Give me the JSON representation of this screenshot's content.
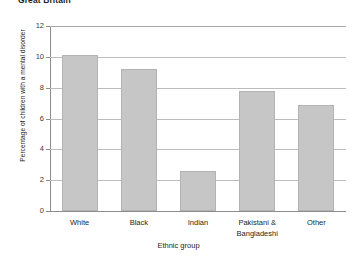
{
  "chart_data": {
    "type": "bar",
    "title": "Great Britain",
    "xlabel": "Ethnic group",
    "ylabel": "Percentage of children with a mental disorder",
    "categories": [
      "White",
      "Black",
      "Indian",
      "Pakistani & Bangladeshi",
      "Other"
    ],
    "values": [
      10.1,
      9.2,
      2.6,
      7.8,
      6.9
    ],
    "ylim": [
      0,
      12
    ],
    "yticks": [
      0,
      2,
      4,
      6,
      8,
      10,
      12
    ],
    "ytick_labels": [
      "0",
      "2",
      "4",
      "6",
      "8",
      "10",
      "12"
    ],
    "grid": true,
    "grid_axis": "y",
    "legend": false,
    "bar_color": "#c6c6c6",
    "bar_edge_color": "#b3b3b3",
    "grid_color": "#bcbcbc",
    "axis_color": "#8d8d8d",
    "text_color": "#231f20",
    "background": "#ffffff"
  },
  "category_labels": [
    {
      "line1": "White",
      "line2": ""
    },
    {
      "line1": "Black",
      "line2": ""
    },
    {
      "line1": "Indian",
      "line2": ""
    },
    {
      "line1": "Pakistani &",
      "line2": "Bangladeshi"
    },
    {
      "line1": "Other",
      "line2": ""
    }
  ]
}
